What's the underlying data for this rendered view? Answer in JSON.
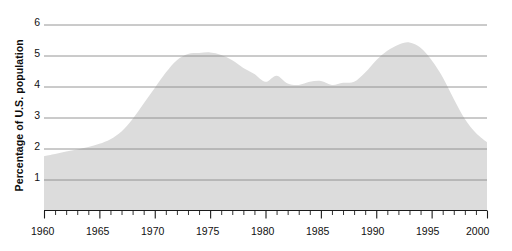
{
  "chart_data": {
    "type": "area",
    "title": "",
    "xlabel": "",
    "ylabel": "Percentage of U.S. population",
    "xlim": [
      1960,
      2000
    ],
    "ylim": [
      0,
      6.3
    ],
    "grid": true,
    "legend": null,
    "y_ticks": [
      1,
      2,
      3,
      4,
      5,
      6
    ],
    "y_tick_labels": [
      "1",
      "2",
      "3",
      "4",
      "5",
      "6"
    ],
    "x_ticks": [
      1960,
      1965,
      1970,
      1975,
      1980,
      1985,
      1990,
      1995,
      2000
    ],
    "x_tick_labels": [
      "1960",
      "1965",
      "1970",
      "1975",
      "1980",
      "1985",
      "1990",
      "1995",
      "2000"
    ],
    "x_minor_tick_step": 1,
    "x": [
      1960,
      1961,
      1962,
      1963,
      1964,
      1965,
      1966,
      1967,
      1968,
      1969,
      1970,
      1971,
      1972,
      1973,
      1974,
      1975,
      1976,
      1977,
      1978,
      1979,
      1980,
      1981,
      1982,
      1983,
      1984,
      1985,
      1986,
      1987,
      1988,
      1989,
      1990,
      1991,
      1992,
      1993,
      1994,
      1995,
      1996,
      1997,
      1998,
      1999,
      2000
    ],
    "values": [
      1.75,
      1.82,
      1.9,
      1.97,
      2.05,
      2.15,
      2.3,
      2.55,
      2.95,
      3.45,
      3.95,
      4.45,
      4.85,
      5.05,
      5.08,
      5.1,
      5.02,
      4.85,
      4.6,
      4.4,
      4.15,
      4.35,
      4.1,
      4.05,
      4.15,
      4.18,
      4.05,
      4.12,
      4.15,
      4.45,
      4.85,
      5.15,
      5.35,
      5.42,
      5.25,
      4.85,
      4.3,
      3.6,
      2.95,
      2.5,
      2.2
    ],
    "colors": {
      "area_fill": "#dcdcdc",
      "gridline": "#8a8a8a",
      "axis": "#1a1a1a",
      "text": "#111111",
      "background": "#ffffff"
    }
  },
  "axis": {
    "y_title": "Percentage of U.S. population"
  }
}
